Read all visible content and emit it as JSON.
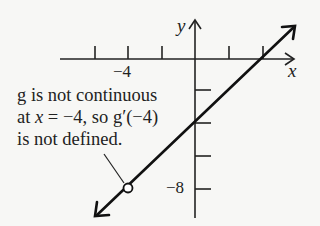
{
  "diagram": {
    "type": "function-graph",
    "function_name": "g",
    "axes": {
      "x_label": "x",
      "y_label": "y"
    },
    "x_tick_label": "−4",
    "y_tick_label": "−8",
    "x_ticks": [
      -6,
      -4,
      -2,
      2,
      4
    ],
    "y_ticks": [
      -2,
      -4,
      -6,
      -8
    ],
    "line": {
      "slope": 1,
      "y_intercept": -4,
      "x_intercept": 4,
      "arrows": "both"
    },
    "open_circle": {
      "x": -4,
      "y": -8
    },
    "annotation": {
      "line1": "g is not continuous",
      "line2_prefix": "at ",
      "line2_var": "x",
      "line2_suffix": " = −4, so g′(−4)",
      "line3": "is not defined."
    },
    "colors": {
      "ink": "#222222",
      "background": "#f7f7f5"
    }
  }
}
